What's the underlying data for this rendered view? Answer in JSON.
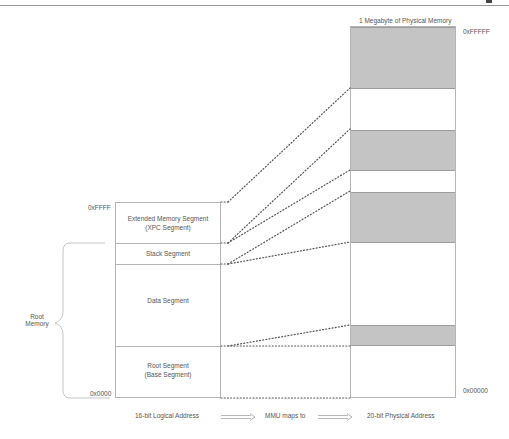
{
  "header": {
    "rule": true
  },
  "physical_memory": {
    "title": "1 Megabyte of Physical Memory",
    "top_address": "0xFFFFF",
    "bottom_address": "0x00000",
    "bands": [
      {
        "top": 0,
        "height": 62,
        "shade": "grey"
      },
      {
        "top": 62,
        "height": 41,
        "shade": "white"
      },
      {
        "top": 103,
        "height": 41,
        "shade": "grey"
      },
      {
        "top": 144,
        "height": 21,
        "shade": "white"
      },
      {
        "top": 165,
        "height": 51,
        "shade": "grey"
      },
      {
        "top": 216,
        "height": 83,
        "shade": "white"
      },
      {
        "top": 299,
        "height": 21,
        "shade": "grey"
      },
      {
        "top": 320,
        "height": 52,
        "shade": "white"
      }
    ]
  },
  "logical_memory": {
    "top_address": "0xFFFF",
    "bottom_address": "0x0000",
    "segments": [
      {
        "line1": "Extended Memory Segment",
        "line2": "(XPC Segment)"
      },
      {
        "line1": "Stack Segment",
        "line2": ""
      },
      {
        "line1": "Data Segment",
        "line2": ""
      },
      {
        "line1": "Root Segment",
        "line2": "(Base Segment)"
      }
    ]
  },
  "bracket": {
    "line1": "Root",
    "line2": "Memory"
  },
  "legend": {
    "left": "16-bit Logical Address",
    "middle": "MMU maps to",
    "right": "20-bit Physical Address"
  },
  "colors": {
    "grey_band": "#c4c4c4",
    "border": "#b5b5b5",
    "dots": "#555555"
  }
}
